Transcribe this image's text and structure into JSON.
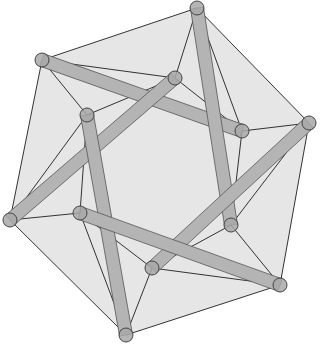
{
  "diagram": {
    "title": "Tensegrity icosahedron",
    "colors": {
      "background": "#ffffff",
      "hull_fill": "#e6e6e6",
      "strut_fill": "#b4b4b4",
      "strut_edge": "#555555",
      "cable": "#333333",
      "node_fill": "#a8a8a8",
      "node_edge": "#444444"
    },
    "strut_width": 13,
    "node_radius": 7,
    "nodes": [
      {
        "id": "A",
        "x": 42,
        "y": 60
      },
      {
        "id": "B",
        "x": 197,
        "y": 8
      },
      {
        "id": "C",
        "x": 309,
        "y": 123
      },
      {
        "id": "D",
        "x": 280,
        "y": 285
      },
      {
        "id": "E",
        "x": 126,
        "y": 335
      },
      {
        "id": "F",
        "x": 10,
        "y": 220
      },
      {
        "id": "G",
        "x": 175,
        "y": 78
      },
      {
        "id": "H",
        "x": 87,
        "y": 115
      },
      {
        "id": "I",
        "x": 242,
        "y": 131
      },
      {
        "id": "J",
        "x": 231,
        "y": 225
      },
      {
        "id": "K",
        "x": 152,
        "y": 268
      },
      {
        "id": "L",
        "x": 80,
        "y": 213
      }
    ],
    "hull": [
      "A",
      "B",
      "C",
      "D",
      "E",
      "F"
    ],
    "struts": [
      [
        "A",
        "I"
      ],
      [
        "B",
        "J"
      ],
      [
        "G",
        "F"
      ],
      [
        "H",
        "E"
      ],
      [
        "C",
        "K"
      ],
      [
        "L",
        "D"
      ]
    ],
    "cables": [
      [
        "A",
        "B"
      ],
      [
        "B",
        "C"
      ],
      [
        "C",
        "D"
      ],
      [
        "D",
        "E"
      ],
      [
        "E",
        "F"
      ],
      [
        "F",
        "A"
      ],
      [
        "A",
        "G"
      ],
      [
        "A",
        "H"
      ],
      [
        "B",
        "G"
      ],
      [
        "B",
        "I"
      ],
      [
        "G",
        "H"
      ],
      [
        "G",
        "I"
      ],
      [
        "C",
        "I"
      ],
      [
        "C",
        "J"
      ],
      [
        "I",
        "J"
      ],
      [
        "D",
        "J"
      ],
      [
        "D",
        "K"
      ],
      [
        "J",
        "K"
      ],
      [
        "E",
        "K"
      ],
      [
        "E",
        "L"
      ],
      [
        "K",
        "L"
      ],
      [
        "F",
        "L"
      ],
      [
        "F",
        "H"
      ],
      [
        "H",
        "L"
      ]
    ]
  }
}
